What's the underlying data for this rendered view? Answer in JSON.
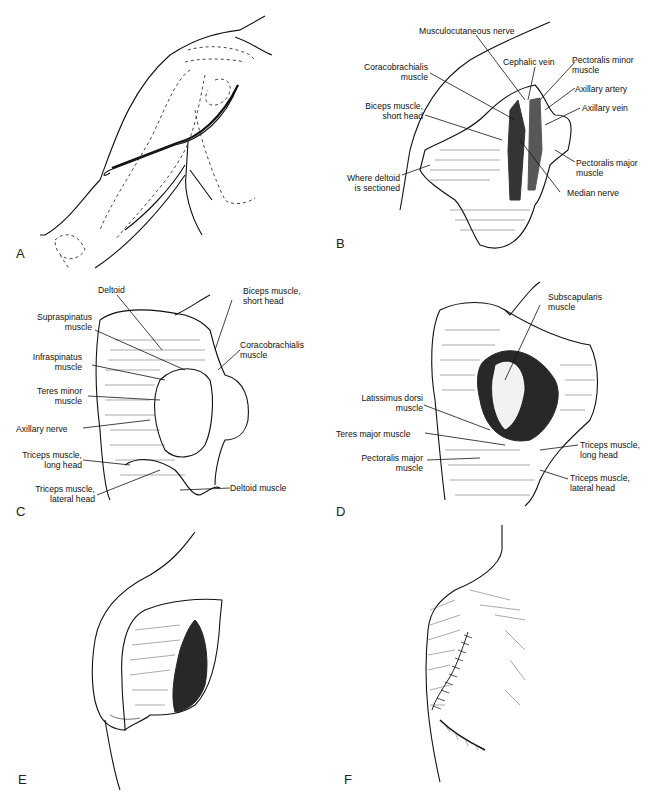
{
  "figure": {
    "panels": [
      {
        "id": "A",
        "letter": "A",
        "labels": []
      },
      {
        "id": "B",
        "letter": "B",
        "labels": [
          "Musculocutaneous nerve",
          "Cephalic vein",
          "Pectoralis minor\nmuscle",
          "Coracobrachialis\nmuscle",
          "Axillary artery",
          "Axillary vein",
          "Biceps muscle,\nshort head",
          "Pectoralis major\nmuscle",
          "Where deltoid\nis sectioned",
          "Median nerve"
        ]
      },
      {
        "id": "C",
        "letter": "C",
        "labels": [
          "Deltoid",
          "Biceps muscle,\nshort head",
          "Supraspinatus\nmuscle",
          "Coracobrachialis\nmuscle",
          "Infraspinatus\nmuscle",
          "Teres minor\nmuscle",
          "Axillary nerve",
          "Triceps muscle,\nlong head",
          "Triceps muscle,\nlateral head",
          "Deltoid muscle"
        ]
      },
      {
        "id": "D",
        "letter": "D",
        "labels": [
          "Subscapularis\nmuscle",
          "Latissimus dorsi\nmuscle",
          "Teres major muscle",
          "Pectoralis major\nmuscle",
          "Triceps muscle,\nlong head",
          "Triceps muscle,\nlateral head"
        ]
      },
      {
        "id": "E",
        "letter": "E",
        "labels": []
      },
      {
        "id": "F",
        "letter": "F",
        "labels": []
      }
    ]
  },
  "B": {
    "musculocutaneous": "Musculocutaneous nerve",
    "cephalic": "Cephalic vein",
    "pec_minor_1": "Pectoralis minor",
    "pec_minor_2": "muscle",
    "coraco_1": "Coracobrachialis",
    "coraco_2": "muscle",
    "ax_artery": "Axillary artery",
    "ax_vein": "Axillary vein",
    "biceps_1": "Biceps muscle,",
    "biceps_2": "short head",
    "pec_major_1": "Pectoralis major",
    "pec_major_2": "muscle",
    "deltoid_1": "Where deltoid",
    "deltoid_2": "is sectioned",
    "median": "Median nerve"
  },
  "C": {
    "deltoid": "Deltoid",
    "biceps_1": "Biceps muscle,",
    "biceps_2": "short head",
    "supra_1": "Supraspinatus",
    "supra_2": "muscle",
    "coraco_1": "Coracobrachialis",
    "coraco_2": "muscle",
    "infra_1": "Infraspinatus",
    "infra_2": "muscle",
    "teres_1": "Teres minor",
    "teres_2": "muscle",
    "axillary": "Axillary nerve",
    "tri_long_1": "Triceps muscle,",
    "tri_long_2": "long head",
    "tri_lat_1": "Triceps muscle,",
    "tri_lat_2": "lateral head",
    "deltoid_muscle": "Deltoid muscle"
  },
  "D": {
    "subscap_1": "Subscapularis",
    "subscap_2": "muscle",
    "lat_1": "Latissimus dorsi",
    "lat_2": "muscle",
    "teres_major": "Teres major muscle",
    "pec_major_1": "Pectoralis major",
    "pec_major_2": "muscle",
    "tri_long_1": "Triceps muscle,",
    "tri_long_2": "long head",
    "tri_lat_1": "Triceps muscle,",
    "tri_lat_2": "lateral head"
  },
  "letters": {
    "A": "A",
    "B": "B",
    "C": "C",
    "D": "D",
    "E": "E",
    "F": "F"
  }
}
